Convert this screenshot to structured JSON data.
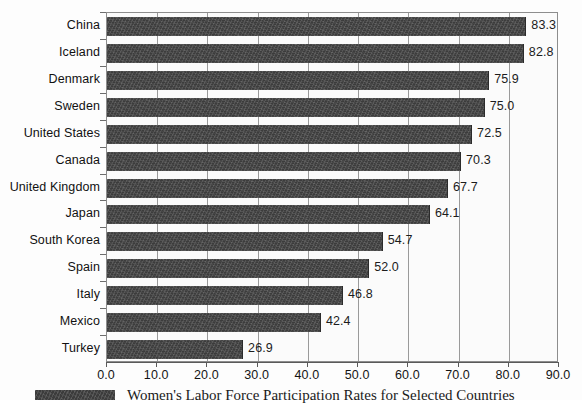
{
  "chart_data": {
    "type": "bar",
    "orientation": "horizontal",
    "title": "",
    "xlabel": "",
    "ylabel": "",
    "xlim": [
      0.0,
      90.0
    ],
    "xticks": [
      "0.0",
      "10.0",
      "20.0",
      "30.0",
      "40.0",
      "50.0",
      "60.0",
      "70.0",
      "80.0",
      "90.0"
    ],
    "xtick_values": [
      0,
      10,
      20,
      30,
      40,
      50,
      60,
      70,
      80,
      90
    ],
    "grid": "vertical",
    "legend_position": "below-left",
    "categories": [
      "China",
      "Iceland",
      "Denmark",
      "Sweden",
      "United States",
      "Canada",
      "United Kingdom",
      "Japan",
      "South Korea",
      "Spain",
      "Italy",
      "Mexico",
      "Turkey"
    ],
    "values": [
      83.3,
      82.8,
      75.9,
      75.0,
      72.5,
      70.3,
      67.7,
      64.1,
      54.7,
      52.0,
      46.8,
      42.4,
      26.9
    ],
    "value_labels": [
      "83.3",
      "82.8",
      "75.9",
      "75.0",
      "72.5",
      "70.3",
      "67.7",
      "64.1",
      "54.7",
      "52.0",
      "46.8",
      "42.4",
      "26.9"
    ],
    "series": [
      {
        "name": "Women's Labor Force Participation Rates for Selected Countries",
        "color": "#3c3c3c",
        "values": [
          83.3,
          82.8,
          75.9,
          75.0,
          72.5,
          70.3,
          67.7,
          64.1,
          54.7,
          52.0,
          46.8,
          42.4,
          26.9
        ]
      }
    ]
  },
  "legend": {
    "label": "Women's Labor Force Participation Rates for Selected Countries",
    "swatch_color": "#3c3c3c"
  },
  "colors": {
    "bar": "#3c3c3c",
    "grid": "#9a9a9a",
    "axis": "#5a5a5a",
    "plot_background": "#fbfbfb",
    "text": "#141414"
  }
}
